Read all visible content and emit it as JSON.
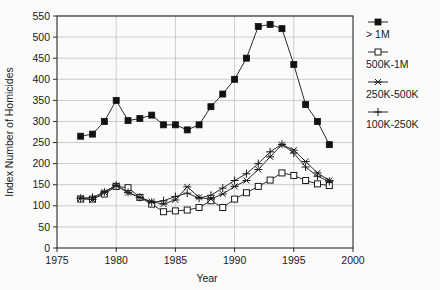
{
  "chart_data": {
    "type": "line",
    "title": "",
    "xlabel": "Year",
    "ylabel": "Index Number of Homicides",
    "xlim": [
      1975,
      2000
    ],
    "ylim": [
      0,
      550
    ],
    "xticks": [
      1975,
      1980,
      1985,
      1990,
      1995,
      2000
    ],
    "yticks": [
      0,
      50,
      100,
      150,
      200,
      250,
      300,
      350,
      400,
      450,
      500,
      550
    ],
    "grid": true,
    "legend_position": "right",
    "x": [
      1977,
      1978,
      1979,
      1980,
      1981,
      1982,
      1983,
      1984,
      1985,
      1986,
      1987,
      1988,
      1989,
      1990,
      1991,
      1992,
      1993,
      1994,
      1995,
      1996,
      1997,
      1998
    ],
    "series": [
      {
        "name": "> 1M",
        "marker": "filled-square",
        "values": [
          265,
          270,
          300,
          350,
          302,
          307,
          315,
          292,
          292,
          280,
          292,
          335,
          365,
          400,
          450,
          525,
          530,
          520,
          435,
          340,
          300,
          245
        ]
      },
      {
        "name": "500K-1M",
        "marker": "open-square",
        "values": [
          116,
          116,
          128,
          146,
          143,
          120,
          104,
          86,
          88,
          90,
          96,
          112,
          96,
          116,
          131,
          146,
          161,
          178,
          172,
          160,
          152,
          148
        ]
      },
      {
        "name": "250K-500K",
        "marker": "asterisk",
        "values": [
          118,
          115,
          132,
          148,
          131,
          120,
          110,
          104,
          114,
          145,
          120,
          116,
          128,
          146,
          160,
          186,
          216,
          245,
          232,
          205,
          178,
          160
        ]
      },
      {
        "name": "100K-250K",
        "marker": "plus",
        "values": [
          118,
          120,
          133,
          149,
          132,
          120,
          108,
          112,
          122,
          130,
          118,
          125,
          142,
          160,
          176,
          200,
          228,
          246,
          225,
          192,
          170,
          158
        ]
      }
    ]
  },
  "legend": {
    "items": [
      {
        "label": "> 1M"
      },
      {
        "label": "500K-1M"
      },
      {
        "label": "250K-500K"
      },
      {
        "label": "100K-250K"
      }
    ]
  },
  "axes": {
    "x_title": "Year",
    "y_title": "Index Number of Homicides"
  }
}
